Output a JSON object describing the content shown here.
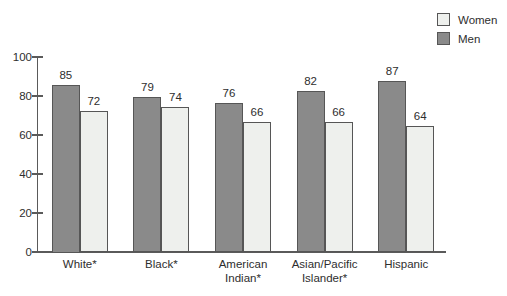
{
  "chart_data": {
    "type": "bar",
    "categories": [
      "White*",
      "Black*",
      "American\nIndian*",
      "Asian/Pacific\nIslander*",
      "Hispanic"
    ],
    "series": [
      {
        "name": "Men",
        "values": [
          85,
          79,
          76,
          82,
          87
        ],
        "color": "#8a8a8a",
        "border_color": "#565656"
      },
      {
        "name": "Women",
        "values": [
          72,
          74,
          66,
          66,
          64
        ],
        "color": "#eef0ed",
        "border_color": "#565656"
      }
    ],
    "legend": [
      {
        "label": "Women",
        "color": "#eef0ed"
      },
      {
        "label": "Men",
        "color": "#8a8a8a"
      }
    ],
    "legend_position": "top-right",
    "title": "",
    "xlabel": "",
    "ylabel": "",
    "y_ticks": [
      0,
      20,
      40,
      60,
      80,
      100
    ],
    "ylim": [
      0,
      100
    ],
    "grid": false,
    "value_labels": true
  },
  "colors": {
    "axis": "#5a5a5a",
    "text": "#2e2e2e"
  }
}
